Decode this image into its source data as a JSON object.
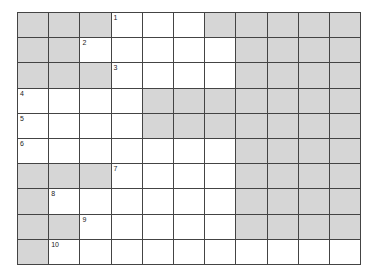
{
  "puzzle": {
    "type": "crossword",
    "columns": 11,
    "rows_count": 10,
    "colors": {
      "block": "#d6d6d6",
      "open": "#ffffff",
      "line": "#444444"
    },
    "rows": [
      "GGGWWWGGGGG",
      "GGWWWWWGGGG",
      "GGGWWWWGGGG",
      "WWWWGGGGGGG",
      "WWWWGGGGGGG",
      "WWWWWWWGGGG",
      "GGGWWWWGGGG",
      "GWWWWWWGGGG",
      "GGWWWWWGGGG",
      "GWWWWWWWWWW"
    ],
    "numbers": [
      {
        "row": 0,
        "col": 3,
        "label": "1"
      },
      {
        "row": 1,
        "col": 2,
        "label": "2"
      },
      {
        "row": 2,
        "col": 3,
        "label": "3"
      },
      {
        "row": 3,
        "col": 0,
        "label": "4"
      },
      {
        "row": 4,
        "col": 0,
        "label": "5"
      },
      {
        "row": 5,
        "col": 0,
        "label": "6"
      },
      {
        "row": 6,
        "col": 3,
        "label": "7"
      },
      {
        "row": 7,
        "col": 1,
        "label": "8"
      },
      {
        "row": 8,
        "col": 2,
        "label": "9"
      },
      {
        "row": 9,
        "col": 1,
        "label": "10"
      }
    ]
  }
}
